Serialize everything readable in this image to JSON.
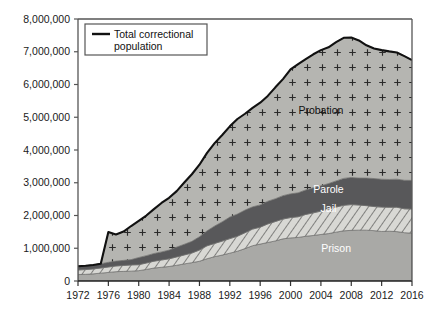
{
  "chart_data": {
    "type": "area",
    "title": "",
    "subtitle": "",
    "xlabel": "",
    "ylabel": "",
    "stacked": true,
    "grid": false,
    "legend_position": "inside-top-left",
    "xlim": [
      1972,
      2016
    ],
    "ylim": [
      0,
      8000000
    ],
    "x": [
      1972,
      1973,
      1974,
      1975,
      1976,
      1977,
      1978,
      1979,
      1980,
      1981,
      1982,
      1983,
      1984,
      1985,
      1986,
      1987,
      1988,
      1989,
      1990,
      1991,
      1992,
      1993,
      1994,
      1995,
      1996,
      1997,
      1998,
      1999,
      2000,
      2001,
      2002,
      2003,
      2004,
      2005,
      2006,
      2007,
      2008,
      2009,
      2010,
      2011,
      2012,
      2013,
      2014,
      2015,
      2016
    ],
    "xticks": [
      1972,
      1976,
      1980,
      1984,
      1988,
      1992,
      1996,
      2000,
      2004,
      2008,
      2012,
      2016
    ],
    "xtick_labels": [
      "1972",
      "1976",
      "1980",
      "1984",
      "1988",
      "1992",
      "1996",
      "2000",
      "2004",
      "2008",
      "2012",
      "2016"
    ],
    "yticks": [
      0,
      1000000,
      2000000,
      3000000,
      4000000,
      5000000,
      6000000,
      7000000,
      8000000
    ],
    "ytick_labels": [
      "0",
      "1,000,000",
      "2,000,000",
      "3,000,000",
      "4,000,000",
      "5,000,000",
      "6,000,000",
      "7,000,000",
      "8,000,000"
    ],
    "series": [
      {
        "name": "Prison",
        "label": "Prison",
        "fill": "#a9a9a6",
        "pattern": "solid",
        "values": [
          196000,
          204000,
          218000,
          240000,
          262000,
          285000,
          294000,
          301000,
          316000,
          353000,
          395000,
          419000,
          443000,
          480000,
          522000,
          560000,
          603000,
          680000,
          743000,
          792000,
          850000,
          909000,
          990000,
          1078000,
          1127000,
          1176000,
          1224000,
          1287000,
          1316000,
          1330000,
          1367000,
          1390000,
          1421000,
          1448000,
          1492000,
          1532000,
          1547000,
          1553000,
          1552000,
          1538000,
          1512000,
          1520000,
          1508000,
          1476000,
          1459000
        ]
      },
      {
        "name": "Jail",
        "label": "Jail",
        "fill": "#d6d6d2",
        "pattern": "diagonal-hatch",
        "values": [
          141000,
          145000,
          150000,
          158000,
          166000,
          174000,
          182000,
          190000,
          182000,
          196000,
          210000,
          223000,
          234000,
          256000,
          274000,
          295000,
          343000,
          395000,
          405000,
          426000,
          444000,
          459000,
          486000,
          507000,
          518000,
          567000,
          592000,
          605000,
          621000,
          631000,
          665000,
          691000,
          714000,
          747000,
          766000,
          780000,
          786000,
          767000,
          749000,
          736000,
          745000,
          731000,
          745000,
          728000,
          740000
        ]
      },
      {
        "name": "Parole",
        "label": "Parole",
        "fill": "#58585a",
        "pattern": "solid",
        "values": [
          113000,
          118000,
          122000,
          130000,
          143000,
          148000,
          154000,
          162000,
          220000,
          225000,
          234000,
          246000,
          266000,
          300000,
          325000,
          355000,
          407000,
          456000,
          531000,
          590000,
          658000,
          677000,
          690000,
          679000,
          679000,
          694000,
          696000,
          714000,
          724000,
          732000,
          750000,
          769000,
          772000,
          780000,
          799000,
          821000,
          828000,
          824000,
          841000,
          855000,
          851000,
          850000,
          857000,
          871000,
          874000
        ]
      },
      {
        "name": "Probation",
        "label": "Probation",
        "fill": "#b4b4b0",
        "pattern": "plus-dots",
        "values": [
          0,
          0,
          0,
          0,
          923000,
          816000,
          880000,
          1026000,
          1118000,
          1225000,
          1357000,
          1494000,
          1597000,
          1709000,
          1887000,
          2050000,
          2198000,
          2382000,
          2531000,
          2650000,
          2770000,
          2902000,
          2941000,
          3022000,
          3119000,
          3214000,
          3402000,
          3559000,
          3802000,
          3932000,
          3995000,
          4073000,
          4143000,
          4162000,
          4236000,
          4293000,
          4271000,
          4203000,
          4055000,
          3973000,
          3942000,
          3910000,
          3868000,
          3790000,
          3673000
        ]
      }
    ],
    "total_line": {
      "name": "Total correctional population",
      "color": "#111111",
      "values": [
        450000,
        467000,
        490000,
        528000,
        1494000,
        1423000,
        1510000,
        1679000,
        1836000,
        1999000,
        2196000,
        2382000,
        2540000,
        2745000,
        3008000,
        3260000,
        3551000,
        3913000,
        4210000,
        4458000,
        4722000,
        4947000,
        5107000,
        5286000,
        5443000,
        5651000,
        5914000,
        6165000,
        6463000,
        6625000,
        6777000,
        6923000,
        7050000,
        7137000,
        7293000,
        7426000,
        7432000,
        7347000,
        7197000,
        7102000,
        7050000,
        7011000,
        6978000,
        6865000,
        6746000
      ]
    },
    "legend": {
      "entries": [
        {
          "label_line1": "Total correctional",
          "label_line2": "population",
          "swatch_color": "#111111",
          "swatch_type": "line"
        }
      ]
    },
    "series_annotations": [
      {
        "text": "Probation",
        "series": "Probation",
        "x_year": 2004,
        "y_value": 5100000
      },
      {
        "text": "Parole",
        "series": "Parole",
        "x_year": 2005,
        "y_value": 2700000
      },
      {
        "text": "Jail",
        "series": "Jail",
        "x_year": 2005,
        "y_value": 2110000
      },
      {
        "text": "Prison",
        "series": "Prison",
        "x_year": 2006,
        "y_value": 880000
      }
    ]
  }
}
